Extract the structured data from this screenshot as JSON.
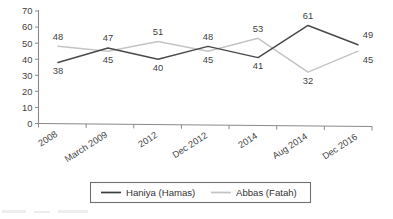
{
  "chart_data": {
    "type": "line",
    "title": "",
    "xlabel": "",
    "ylabel": "",
    "categories": [
      "2008",
      "March 2009",
      "2012",
      "Dec 2012",
      "2014",
      "Aug 2014",
      "Dec 2016"
    ],
    "series": [
      {
        "name": "Haniya (Hamas)",
        "color": "#4a4a4a",
        "values": [
          38,
          47,
          40,
          48,
          41,
          61,
          49
        ],
        "label_positions": [
          "below",
          "above",
          "below",
          "above",
          "below",
          "above",
          "above"
        ]
      },
      {
        "name": "Abbas (Fatah)",
        "color": "#c4c4c4",
        "values": [
          48,
          45,
          51,
          45,
          53,
          32,
          45
        ],
        "label_positions": [
          "above",
          "below",
          "above",
          "below",
          "above",
          "below",
          "below"
        ]
      }
    ],
    "ylim": [
      0,
      70
    ],
    "yticks": [
      0,
      10,
      20,
      30,
      40,
      50,
      60,
      70
    ],
    "ytick_labels": [
      "0",
      "10",
      "20",
      "30",
      "40",
      "50",
      "60",
      "70"
    ],
    "grid": false,
    "legend_position": "bottom"
  },
  "legend": {
    "entries": [
      {
        "label": "Haniya (Hamas)"
      },
      {
        "label": "Abbas (Fatah)"
      }
    ]
  },
  "axis": {
    "y_tick_0": "0",
    "y_tick_10": "10",
    "y_tick_20": "20",
    "y_tick_30": "30",
    "y_tick_40": "40",
    "y_tick_50": "50",
    "y_tick_60": "60",
    "y_tick_70": "70"
  }
}
